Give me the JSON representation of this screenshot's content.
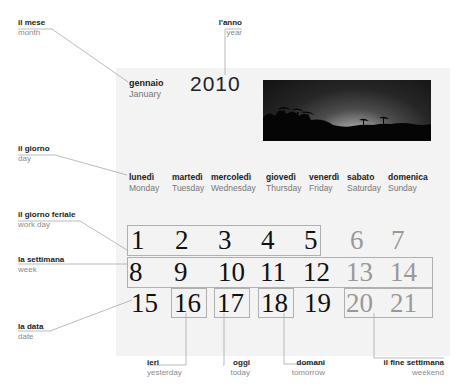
{
  "annotations": {
    "month": {
      "it": "il mese",
      "en": "month"
    },
    "year": {
      "it": "l'anno",
      "en": "year"
    },
    "day": {
      "it": "il giorno",
      "en": "day"
    },
    "workday": {
      "it": "il giorno feriale",
      "en": "work day"
    },
    "week": {
      "it": "la settimana",
      "en": "week"
    },
    "date": {
      "it": "la data",
      "en": "date"
    },
    "yesterday": {
      "it": "ieri",
      "en": "yesterday"
    },
    "today": {
      "it": "oggi",
      "en": "today"
    },
    "tomorrow": {
      "it": "domani",
      "en": "tomorrow"
    },
    "weekend": {
      "it": "il fine settimana",
      "en": "weekend"
    }
  },
  "calendar": {
    "month": {
      "it": "gennaio",
      "en": "January"
    },
    "year": "2010",
    "days_of_week": [
      {
        "it": "lunedì",
        "en": "Monday"
      },
      {
        "it": "martedì",
        "en": "Tuesday"
      },
      {
        "it": "mercoledì",
        "en": "Wednesday"
      },
      {
        "it": "giovedì",
        "en": "Thursday"
      },
      {
        "it": "venerdì",
        "en": "Friday"
      },
      {
        "it": "sabato",
        "en": "Saturday"
      },
      {
        "it": "domenica",
        "en": "Sunday"
      }
    ],
    "weeks": [
      [
        "1",
        "2",
        "3",
        "4",
        "5",
        "6",
        "7"
      ],
      [
        "8",
        "9",
        "10",
        "11",
        "12",
        "13",
        "14"
      ],
      [
        "15",
        "16",
        "17",
        "18",
        "19",
        "20",
        "21"
      ]
    ]
  },
  "colors": {
    "panel": "#f3f3f3",
    "weekend_text": "#999999",
    "box_border": "#b0b0b0",
    "leader": "#aaaaaa"
  }
}
